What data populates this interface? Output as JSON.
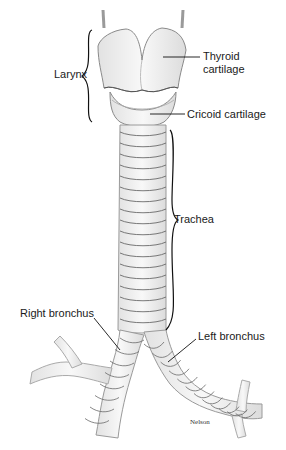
{
  "figure": {
    "labels": {
      "larynx": "Larynx",
      "thyroid_line1": "Thyroid",
      "thyroid_line2": "cartilage",
      "cricoid": "Cricoid cartilage",
      "trachea": "Trachea",
      "right_bronchus": "Right bronchus",
      "left_bronchus": "Left bronchus"
    },
    "credit": "Nelson"
  },
  "colors": {
    "background": "#ffffff",
    "outline": "#8a8a8a",
    "ring_shadow": "#555555",
    "fill": "#f1f1f1",
    "leader": "#111111"
  }
}
